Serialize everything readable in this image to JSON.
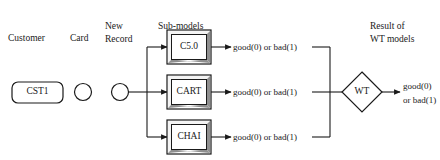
{
  "figure": {
    "background_color": "#ffffff",
    "line_color": "#1a1a1a",
    "bevel_light": "#f2f2f2",
    "bevel_shadow": "#8c8c8c"
  },
  "column_headers": [
    {
      "id": "customer",
      "label": "Customer"
    },
    {
      "id": "card",
      "label": "Card"
    },
    {
      "id": "new-record",
      "line1": "New",
      "line2": "Record"
    },
    {
      "id": "sub-models",
      "label": "Sub-models"
    },
    {
      "id": "result",
      "line1": "Result of",
      "line2": "WT models"
    }
  ],
  "nodes": {
    "customer": {
      "label": "CST1",
      "shape": "rounded-rectangle"
    },
    "card": {
      "label": "",
      "shape": "circle"
    },
    "new_record": {
      "label": "",
      "shape": "circle"
    },
    "submodels": [
      {
        "id": "c50",
        "label": "C5.0",
        "shape": "beveled-rectangle"
      },
      {
        "id": "cart",
        "label": "CART",
        "shape": "beveled-rectangle"
      },
      {
        "id": "chai",
        "label": "CHAI",
        "shape": "beveled-rectangle"
      }
    ],
    "combiner": {
      "label": "WT",
      "shape": "diamond"
    }
  },
  "edge_labels": [
    {
      "id": "c50-out",
      "label": "good(0) or bad(1)"
    },
    {
      "id": "cart-out",
      "label": "good(0) or bad(1)"
    },
    {
      "id": "chai-out",
      "label": "good(0) or bad(1)"
    }
  ],
  "output": {
    "line1": "good(0)",
    "line2": "or bad(1)"
  }
}
